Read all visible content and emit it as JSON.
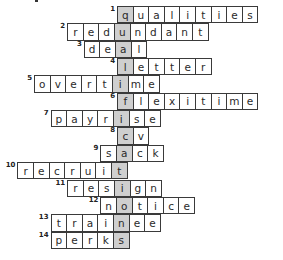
{
  "puzzle": {
    "type": "crossword",
    "key_word": "QUALIFICATIONS",
    "key_color": "#cfcfcf",
    "border_color": "#3a3a3a",
    "entries": [
      {
        "number": "1",
        "answer": "qualities",
        "key_index": 0
      },
      {
        "number": "2",
        "answer": "redundant",
        "key_index": 3
      },
      {
        "number": "3",
        "answer": "deal",
        "key_index": 2
      },
      {
        "number": "4",
        "answer": "letter",
        "key_index": 0
      },
      {
        "number": "5",
        "answer": "overtime",
        "key_index": 5
      },
      {
        "number": "6",
        "answer": "flexitime",
        "key_index": 0
      },
      {
        "number": "7",
        "answer": "payrise",
        "key_index": 4
      },
      {
        "number": "8",
        "answer": "cv",
        "key_index": 0
      },
      {
        "number": "9",
        "answer": "sack",
        "key_index": 1
      },
      {
        "number": "10",
        "answer": "recruit",
        "key_index": 6
      },
      {
        "number": "11",
        "answer": "resign",
        "key_index": 3
      },
      {
        "number": "12",
        "answer": "notice",
        "key_index": 1
      },
      {
        "number": "13",
        "answer": "trainee",
        "key_index": 4
      },
      {
        "number": "14",
        "answer": "perks",
        "key_index": 4
      }
    ]
  }
}
